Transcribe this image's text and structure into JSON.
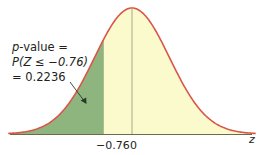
{
  "chart_data": {
    "type": "area",
    "title": "",
    "xlabel": "z",
    "ylabel": "",
    "distribution": "standard normal",
    "x_ticks": [
      {
        "value": -0.76,
        "label": "−0.76"
      },
      {
        "value": 0,
        "label": "0"
      }
    ],
    "shaded_region": {
      "from": "-inf",
      "to": -0.76,
      "area": 0.2236,
      "color": "#8fb57f"
    },
    "unshaded_fill_color": "#fbfacd",
    "curve_color": "#d9574a",
    "axis_color": "#6b6b4a",
    "xlim": [
      -3.3,
      3.3
    ],
    "grid": false,
    "annotation": {
      "line1_prefix": "p",
      "line1_suffix": "-value =",
      "line2": "P(Z ≤ −0.76)",
      "line3": "= 0.2236",
      "arrow_points_to": "shaded left tail"
    }
  }
}
